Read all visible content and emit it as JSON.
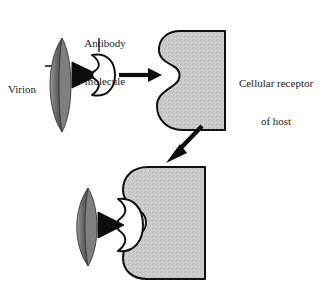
{
  "figure": {
    "background_color": "#ffffff",
    "stroke_color": "#000000",
    "fill_gray": "#c9c9c9",
    "virion_gray": "#7d7d7d",
    "antibody_fill": "#ffffff"
  },
  "labels": {
    "virion": "Virion",
    "antibody_line1": "Antibody",
    "antibody_line2": "molecule",
    "receptor_line1": "Cellular receptor",
    "receptor_line2": "of host"
  },
  "panels": {
    "top": {
      "name": "free-virion-antibody-and-receptor",
      "virion": {
        "name": "virion-crescent",
        "x": 52,
        "y": 38,
        "w": 34,
        "h": 94
      },
      "spike": {
        "name": "virion-spike-triangle",
        "x": 78,
        "y": 62,
        "w": 22,
        "h": 26
      },
      "antibody": {
        "name": "antibody-molecule",
        "x": 84,
        "y": 54,
        "w": 29,
        "h": 43
      },
      "arrow": {
        "name": "binding-arrow-right",
        "from_x": 119,
        "from_y": 75,
        "to_x": 160,
        "to_y": 75
      },
      "receptor": {
        "name": "cellular-receptor-top",
        "x": 157,
        "y": 30,
        "w": 68,
        "h": 101
      }
    },
    "transition": {
      "arrow": {
        "name": "transition-arrow-diagonal",
        "from_x": 201,
        "from_y": 127,
        "to_x": 167,
        "to_y": 163
      }
    },
    "bottom": {
      "name": "blocked-attachment-complex",
      "virion": {
        "name": "virion-crescent-bound",
        "x": 78,
        "y": 188,
        "w": 32,
        "h": 78
      },
      "spike": {
        "name": "virion-spike-triangle-bound",
        "x": 102,
        "y": 212,
        "w": 22,
        "h": 26
      },
      "antibody": {
        "name": "antibody-molecule-bound",
        "x": 108,
        "y": 198,
        "w": 34,
        "h": 56
      },
      "receptor": {
        "name": "cellular-receptor-bottom",
        "x": 122,
        "y": 166,
        "w": 83,
        "h": 114
      }
    }
  }
}
